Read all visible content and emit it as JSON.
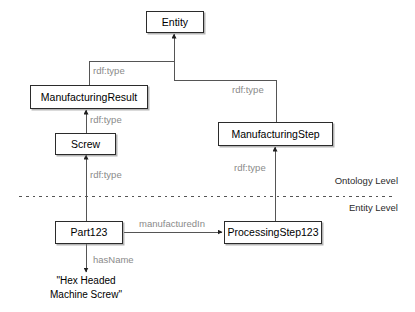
{
  "diagram": {
    "colors": {
      "node_border": "#2b2b2b",
      "node_fill": "#ffffff",
      "edge_line": "#555555",
      "edge_label": "#8a8a8a",
      "divider": "#555555",
      "text": "#000000"
    },
    "nodes": [
      {
        "id": "entity",
        "label": "Entity",
        "level": "ontology"
      },
      {
        "id": "manufacturingresult",
        "label": "ManufacturingResult",
        "level": "ontology"
      },
      {
        "id": "screw",
        "label": "Screw",
        "level": "ontology"
      },
      {
        "id": "manufacturingstep",
        "label": "ManufacturingStep",
        "level": "ontology"
      },
      {
        "id": "part123",
        "label": "Part123",
        "level": "entity"
      },
      {
        "id": "processingstep123",
        "label": "ProcessingStep123",
        "level": "entity"
      }
    ],
    "edges": [
      {
        "id": "e1",
        "from": "manufacturingresult",
        "to": "entity",
        "label": "rdf:type"
      },
      {
        "id": "e2",
        "from": "manufacturingstep",
        "to": "entity",
        "label": "rdf:type"
      },
      {
        "id": "e3",
        "from": "screw",
        "to": "manufacturingresult",
        "label": "rdf:type"
      },
      {
        "id": "e4",
        "from": "part123",
        "to": "screw",
        "label": "rdf:type"
      },
      {
        "id": "e5",
        "from": "processingstep123",
        "to": "manufacturingstep",
        "label": "rdf:type"
      },
      {
        "id": "e6",
        "from": "part123",
        "to": "processingstep123",
        "label": "manufacturedIn"
      },
      {
        "id": "e7",
        "from": "part123",
        "to": "literal",
        "label": "hasName"
      }
    ],
    "literal": {
      "line1": "\"Hex Headed",
      "line2": "Machine Screw\""
    },
    "levels": {
      "ontology": "Ontology Level",
      "entity": "Entity Level"
    }
  }
}
